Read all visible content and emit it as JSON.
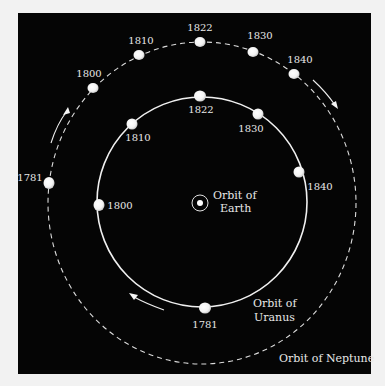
{
  "diagram": {
    "colors": {
      "page_background": "#f2f2f2",
      "panel_background": "#050505",
      "orbit_line": "#f0f0f0",
      "planet": "#f5f5f5",
      "text": "#e8e8e8"
    },
    "earth": {
      "label_line1": "Orbit of",
      "label_line2": "Earth",
      "symbol": "sun-with-earth-orbit"
    },
    "uranus_orbit": {
      "label_line1": "Orbit of",
      "label_line2": "Uranus",
      "style": "solid",
      "positions": [
        {
          "year": "1781"
        },
        {
          "year": "1800"
        },
        {
          "year": "1810"
        },
        {
          "year": "1822"
        },
        {
          "year": "1830"
        },
        {
          "year": "1840"
        }
      ]
    },
    "neptune_orbit": {
      "label": "Orbit of Neptune",
      "style": "dashed",
      "positions": [
        {
          "year": "1781"
        },
        {
          "year": "1800"
        },
        {
          "year": "1810"
        },
        {
          "year": "1822"
        },
        {
          "year": "1830"
        },
        {
          "year": "1840"
        }
      ]
    },
    "arrows": [
      {
        "name": "neptune-direction-arrow-left",
        "direction": "counterclockwise"
      },
      {
        "name": "neptune-direction-arrow-right",
        "direction": "clockwise-visual"
      },
      {
        "name": "uranus-direction-arrow-bottom",
        "direction": "counterclockwise"
      }
    ]
  }
}
